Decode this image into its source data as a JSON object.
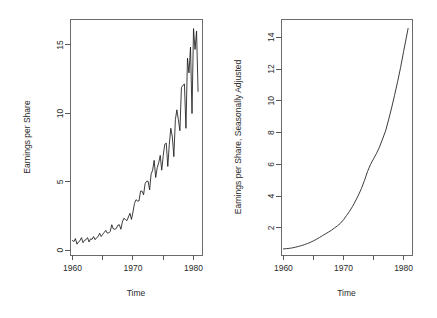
{
  "figure": {
    "panel_count": 2,
    "background": "#ffffff",
    "line_color": "#1a1a1a",
    "axis_color": "#595959"
  },
  "chart_data": [
    {
      "type": "line",
      "panel": "left",
      "title": "",
      "xlabel": "Time",
      "ylabel": "Earnings per Share",
      "xlim": [
        1959.6,
        1981.4
      ],
      "ylim": [
        -0.35,
        16.9
      ],
      "grid": false,
      "legend": null,
      "xticks": [
        1960,
        1965,
        1970,
        1975,
        1980
      ],
      "xticklabels": [
        "1960",
        "",
        "1970",
        "",
        "1980"
      ],
      "yticks": [
        0,
        5,
        10,
        15
      ],
      "yticklabels": [
        "0",
        "5",
        "10",
        "15"
      ],
      "series": [
        {
          "name": "Quarterly Earnings per Share",
          "x": [
            1960.0,
            1960.25,
            1960.5,
            1960.75,
            1961.0,
            1961.25,
            1961.5,
            1961.75,
            1962.0,
            1962.25,
            1962.5,
            1962.75,
            1963.0,
            1963.25,
            1963.5,
            1963.75,
            1964.0,
            1964.25,
            1964.5,
            1964.75,
            1965.0,
            1965.25,
            1965.5,
            1965.75,
            1966.0,
            1966.25,
            1966.5,
            1966.75,
            1967.0,
            1967.25,
            1967.5,
            1967.75,
            1968.0,
            1968.25,
            1968.5,
            1968.75,
            1969.0,
            1969.25,
            1969.5,
            1969.75,
            1970.0,
            1970.25,
            1970.5,
            1970.75,
            1971.0,
            1971.25,
            1971.5,
            1971.75,
            1972.0,
            1972.25,
            1972.5,
            1972.75,
            1973.0,
            1973.25,
            1973.5,
            1973.75,
            1974.0,
            1974.25,
            1974.5,
            1974.75,
            1975.0,
            1975.25,
            1975.5,
            1975.75,
            1976.0,
            1976.25,
            1976.5,
            1976.75,
            1977.0,
            1977.25,
            1977.5,
            1977.75,
            1978.0,
            1978.25,
            1978.5,
            1978.75,
            1979.0,
            1979.25,
            1979.5,
            1979.75,
            1980.0,
            1980.25,
            1980.5,
            1980.75
          ],
          "values": [
            0.71,
            0.63,
            0.85,
            0.44,
            0.61,
            0.69,
            0.92,
            0.55,
            0.72,
            0.77,
            0.92,
            0.6,
            0.83,
            0.8,
            1.0,
            0.77,
            0.92,
            1.0,
            1.24,
            1.0,
            1.16,
            1.3,
            1.45,
            1.25,
            1.26,
            1.38,
            1.86,
            1.56,
            1.53,
            1.59,
            1.83,
            1.86,
            1.53,
            2.07,
            2.34,
            2.25,
            2.16,
            2.43,
            2.7,
            2.25,
            2.79,
            3.42,
            3.69,
            3.6,
            3.6,
            4.32,
            4.32,
            4.05,
            4.86,
            5.04,
            5.04,
            4.41,
            5.58,
            5.85,
            6.57,
            5.31,
            6.03,
            6.39,
            6.93,
            5.85,
            6.93,
            7.74,
            7.83,
            6.12,
            7.74,
            8.91,
            8.28,
            6.84,
            9.54,
            10.26,
            9.54,
            8.73,
            11.88,
            12.06,
            12.15,
            8.91,
            14.04,
            12.96,
            14.85,
            9.99,
            16.2,
            14.67,
            16.02,
            11.61
          ]
        }
      ]
    },
    {
      "type": "line",
      "panel": "right",
      "title": "",
      "xlabel": "Time",
      "ylabel": "Earnings per Share, Seasonally Adjusted",
      "xlim": [
        1959.6,
        1981.4
      ],
      "ylim": [
        0.3,
        15.15
      ],
      "grid": false,
      "legend": null,
      "xticks": [
        1960,
        1965,
        1970,
        1975,
        1980
      ],
      "xticklabels": [
        "1960",
        "",
        "1970",
        "",
        "1980"
      ],
      "yticks": [
        2,
        4,
        6,
        8,
        10,
        12,
        14
      ],
      "yticklabels": [
        "2",
        "4",
        "6",
        "8",
        "10",
        "12",
        "14"
      ],
      "series": [
        {
          "name": "Seasonally Adjusted Earnings per Share",
          "x": [
            1960.0,
            1960.5,
            1961.0,
            1961.5,
            1962.0,
            1962.5,
            1963.0,
            1963.5,
            1964.0,
            1964.5,
            1965.0,
            1965.5,
            1966.0,
            1966.5,
            1967.0,
            1967.5,
            1968.0,
            1968.5,
            1969.0,
            1969.5,
            1970.0,
            1970.5,
            1971.0,
            1971.5,
            1972.0,
            1972.5,
            1973.0,
            1973.5,
            1974.0,
            1974.5,
            1975.0,
            1975.5,
            1976.0,
            1976.5,
            1977.0,
            1977.5,
            1978.0,
            1978.5,
            1979.0,
            1979.5,
            1980.0,
            1980.75
          ],
          "values": [
            0.68,
            0.7,
            0.72,
            0.75,
            0.79,
            0.84,
            0.89,
            0.95,
            1.02,
            1.1,
            1.19,
            1.29,
            1.4,
            1.52,
            1.63,
            1.74,
            1.86,
            2.0,
            2.14,
            2.3,
            2.52,
            2.78,
            3.05,
            3.35,
            3.7,
            4.08,
            4.5,
            5.0,
            5.55,
            6.0,
            6.35,
            6.7,
            7.1,
            7.6,
            8.1,
            8.8,
            9.55,
            10.35,
            11.2,
            12.1,
            13.1,
            14.55
          ]
        }
      ]
    }
  ]
}
